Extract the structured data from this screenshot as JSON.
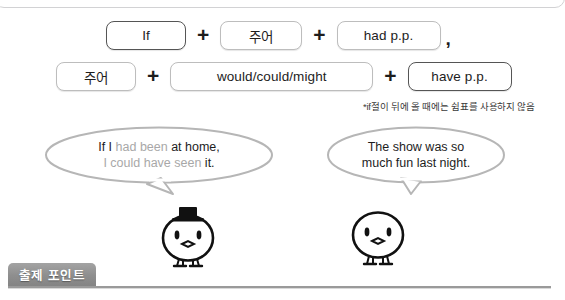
{
  "page": {
    "language": "ko",
    "accent_gray": "#8e8e8e",
    "highlight_gray": "#a8a8a8",
    "ink": "#1d1d1d"
  },
  "formula": {
    "row1": {
      "chips": [
        {
          "label": "If",
          "style": "dark"
        },
        {
          "label": "주어",
          "style": "light"
        },
        {
          "label": "had p.p.",
          "style": "light"
        }
      ],
      "operator": "+",
      "trailing_punctuation": ","
    },
    "row2": {
      "chips": [
        {
          "label": "주어",
          "style": "light"
        },
        {
          "label": "would/could/might",
          "style": "light"
        },
        {
          "label": "have p.p.",
          "style": "dark"
        }
      ],
      "operator": "+"
    },
    "footnote": "*if절이 뒤에 올 때에는 쉼표를 사용하지 않음"
  },
  "bubbles": {
    "left": {
      "line1_a": "If I ",
      "line1_hl": "had been",
      "line1_b": " at home,",
      "line2_hl": "I could have seen",
      "line2_b": " it."
    },
    "right": {
      "line1": "The show was so",
      "line2": "much fun last night."
    }
  },
  "characters": {
    "left": {
      "name": "chick-with-top-hat",
      "has_hat": true
    },
    "right": {
      "name": "chick-plain",
      "has_hat": false
    }
  },
  "bottom": {
    "section_label": "출제 포인트"
  }
}
